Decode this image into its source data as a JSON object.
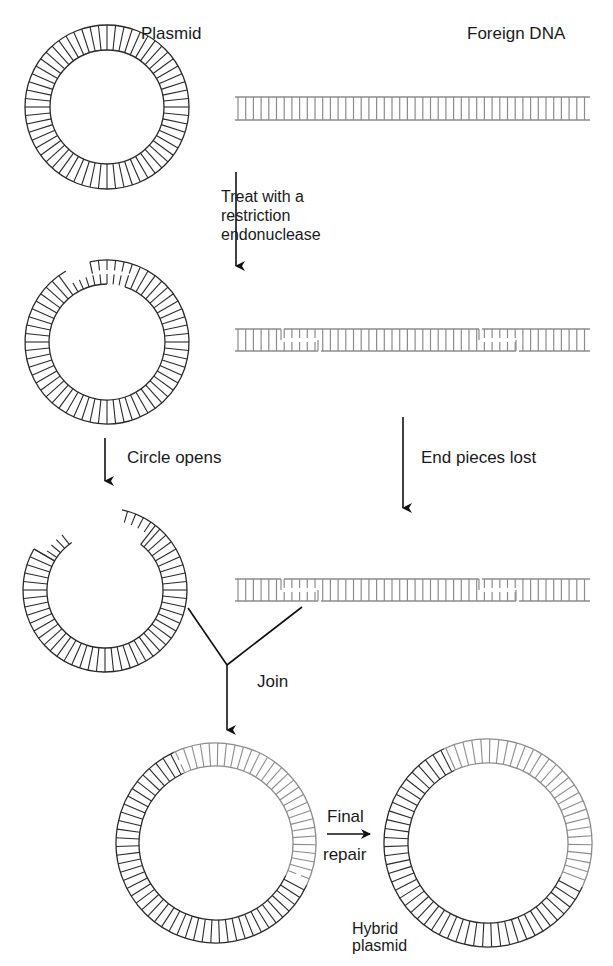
{
  "labels": {
    "plasmid": "Plasmid",
    "foreign_dna": "Foreign DNA",
    "step1": "Treat with a\nrestriction\nendonuclease",
    "circle_opens": "Circle opens",
    "end_pieces_lost": "End pieces lost",
    "join": "Join",
    "final_repair_1": "Final",
    "final_repair_2": "repair",
    "hybrid_plasmid": "Hybrid\nplasmid"
  },
  "colors": {
    "plasmid": "#2a2a2a",
    "foreign": "#8c8c8c",
    "arrow": "#111111",
    "text": "#1a1a1a"
  },
  "diagram": {
    "plasmid_circle": {
      "cx": 107,
      "cy": 107,
      "r_outer": 82,
      "r_inner": 57,
      "rungs": 60
    },
    "foreign_strand": {
      "x1": 235,
      "x2": 590,
      "y_top": 97,
      "y_bot": 120,
      "rung_spacing": 7.7
    },
    "cut_plasmid": {
      "cx": 107,
      "cy": 342,
      "r_outer": 82,
      "r_inner": 58
    },
    "cut_strand": {
      "y_top": 329,
      "y_bot": 351,
      "cuts": [
        [
          281,
          318
        ],
        [
          479,
          516
        ]
      ]
    },
    "open_plasmid": {
      "cx": 105,
      "cy": 590,
      "r_outer": 82,
      "r_inner": 58
    },
    "fragment_strand": {
      "y_top": 579,
      "y_bot": 601
    },
    "joined_circle": {
      "cx": 216,
      "cy": 843,
      "r_outer": 100,
      "r_inner": 77
    },
    "hybrid_circle": {
      "cx": 488,
      "cy": 843,
      "r_outer": 104,
      "r_inner": 80
    }
  }
}
